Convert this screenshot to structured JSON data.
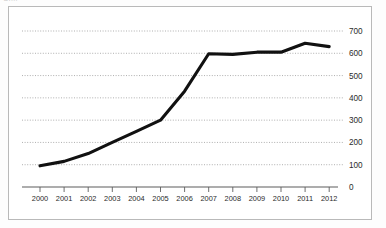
{
  "figure": {
    "caption_fragment": "Gr...",
    "frame_color": "#b9b9b9",
    "background": "#ffffff"
  },
  "chart_data": {
    "type": "line",
    "title": "",
    "subtitle": "",
    "xlabel": "",
    "ylabel": "",
    "categories": [
      "2000",
      "2001",
      "2002",
      "2003",
      "2004",
      "2005",
      "2006",
      "2007",
      "2008",
      "2009",
      "2010",
      "2011",
      "2012"
    ],
    "x": [
      2000,
      2001,
      2002,
      2003,
      2004,
      2005,
      2006,
      2007,
      2008,
      2009,
      2010,
      2011,
      2012
    ],
    "values": [
      95,
      115,
      150,
      200,
      250,
      300,
      430,
      598,
      595,
      605,
      605,
      645,
      630
    ],
    "series": [
      {
        "name": "series-1",
        "color": "#111111",
        "values": [
          95,
          115,
          150,
          200,
          250,
          300,
          430,
          598,
          595,
          605,
          605,
          645,
          630
        ]
      }
    ],
    "xlim": [
      2000,
      2012
    ],
    "ylim": [
      0,
      700
    ],
    "y_ticks": [
      0,
      100,
      200,
      300,
      400,
      500,
      600,
      700
    ],
    "y_tick_labels": [
      "0",
      "100",
      "200",
      "300",
      "400",
      "500",
      "600",
      "700"
    ],
    "x_tick_labels": [
      "2000",
      "2001",
      "2002",
      "2003",
      "2004",
      "2005",
      "2006",
      "2007",
      "2008",
      "2009",
      "2010",
      "2011",
      "2012"
    ],
    "y_axis_position": "right",
    "x_axis_position": "bottom",
    "grid": true,
    "grid_style": "dotted-horizontal",
    "grid_color": "#8c8c8c",
    "legend": false,
    "legend_position": "none",
    "annotations": []
  }
}
